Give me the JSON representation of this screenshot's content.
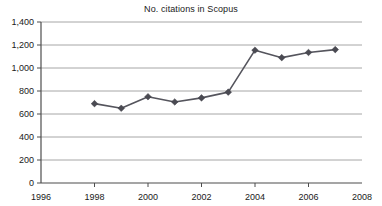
{
  "chart_data": {
    "type": "line",
    "title": "No. citations in Scopus",
    "xlabel": "",
    "ylabel": "",
    "x": [
      1998,
      1999,
      2000,
      2001,
      2002,
      2003,
      2004,
      2005,
      2006,
      2007
    ],
    "values": [
      690,
      650,
      750,
      705,
      740,
      790,
      1155,
      1090,
      1135,
      1160
    ],
    "series": [
      {
        "name": "No. citations in Scopus",
        "values": [
          690,
          650,
          750,
          705,
          740,
          790,
          1155,
          1090,
          1135,
          1160
        ]
      }
    ],
    "xlim": [
      1996,
      2008
    ],
    "ylim": [
      0,
      1400
    ],
    "xticks": [
      1996,
      1998,
      2000,
      2002,
      2004,
      2006,
      2008
    ],
    "xtick_labels": [
      "1996",
      "1998",
      "2000",
      "2002",
      "2004",
      "2006",
      "2008"
    ],
    "yticks": [
      0,
      200,
      400,
      600,
      800,
      1000,
      1200,
      1400
    ],
    "ytick_labels": [
      "0",
      "200",
      "400",
      "600",
      "800",
      "1,000",
      "1,200",
      "1,400"
    ],
    "grid": true,
    "grid_axis": "y",
    "legend": false,
    "legend_position": "none",
    "marker": "diamond",
    "colors": {
      "line": "#55555d",
      "marker": "#4a4a52",
      "grid": "#a6a6a6",
      "axis": "#4d4d4d",
      "text": "#1a1a1a",
      "background": "#ffffff"
    }
  }
}
